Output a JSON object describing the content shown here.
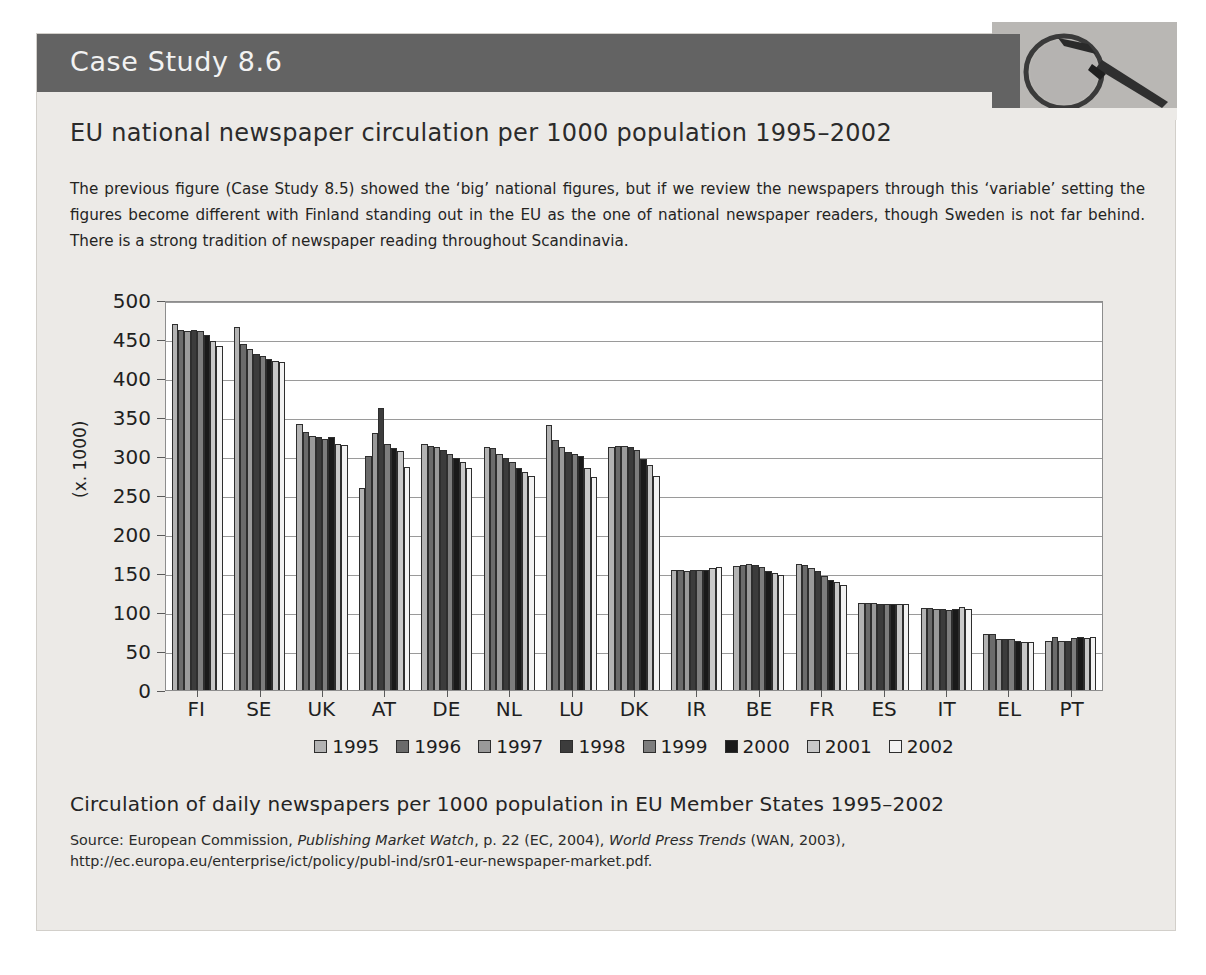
{
  "header": {
    "case_study_label": "Case Study 8.6",
    "icon": "magnifying-glass-icon",
    "bar_color": "#636363"
  },
  "page_title": "EU national newspaper circulation per 1000 population 1995–2002",
  "intro_paragraph": "The previous figure (Case Study 8.5) showed the ‘big’ national figures, but if we review the newspapers through this ‘variable’ setting the figures become different with Finland standing out in the EU as the one of national newspaper readers, though Sweden is not far behind. There is a strong tradition of newspaper reading throughout Scandinavia.",
  "caption": "Circulation of daily newspapers per 1000 population in EU Member States 1995–2002",
  "source": {
    "prefix": "Source: European Commission, ",
    "italic1": "Publishing Market Watch",
    "mid": ", p. 22 (EC, 2004), ",
    "italic2": "World Press Trends",
    "suffix": " (WAN, 2003), http://ec.europa.eu/enterprise/ict/policy/publ-ind/sr01-eur-newspaper-market.pdf."
  },
  "chart_data": {
    "type": "bar",
    "title": "EU national newspaper circulation per 1000 population 1995–2002",
    "xlabel": "",
    "ylabel": "(x. 1000)",
    "ylim": [
      0,
      500
    ],
    "yticks": [
      0,
      50,
      100,
      150,
      200,
      250,
      300,
      350,
      400,
      450,
      500
    ],
    "grid": true,
    "legend_position": "bottom",
    "categories": [
      "FI",
      "SE",
      "UK",
      "AT",
      "DE",
      "NL",
      "LU",
      "DK",
      "IR",
      "BE",
      "FR",
      "ES",
      "IT",
      "EL",
      "PT"
    ],
    "series": [
      {
        "name": "1995",
        "color": "#b3b3b3",
        "values": [
          469,
          465,
          341,
          259,
          315,
          311,
          340,
          311,
          154,
          159,
          162,
          111,
          105,
          72,
          63
        ]
      },
      {
        "name": "1996",
        "color": "#6b6b6b",
        "values": [
          462,
          443,
          331,
          300,
          313,
          310,
          320,
          313,
          154,
          160,
          160,
          111,
          105,
          72,
          68
        ]
      },
      {
        "name": "1997",
        "color": "#9a9a9a",
        "values": [
          460,
          437,
          326,
          330,
          311,
          302,
          312,
          313,
          153,
          161,
          157,
          111,
          104,
          66,
          63
        ]
      },
      {
        "name": "1998",
        "color": "#3c3c3c",
        "values": [
          461,
          431,
          325,
          362,
          308,
          298,
          305,
          311,
          154,
          160,
          152,
          110,
          104,
          66,
          63
        ]
      },
      {
        "name": "1999",
        "color": "#7d7d7d",
        "values": [
          460,
          428,
          322,
          315,
          303,
          292,
          302,
          308,
          154,
          158,
          146,
          110,
          103,
          65,
          67
        ]
      },
      {
        "name": "2000",
        "color": "#1a1a1a",
        "values": [
          455,
          424,
          324,
          310,
          297,
          285,
          300,
          296,
          154,
          153,
          141,
          110,
          104,
          63,
          68
        ]
      },
      {
        "name": "2001",
        "color": "#c8c8c8",
        "values": [
          447,
          422,
          315,
          307,
          292,
          280,
          285,
          288,
          157,
          150,
          138,
          110,
          106,
          62,
          67
        ]
      },
      {
        "name": "2002",
        "color": "#f2f2f2",
        "values": [
          441,
          420,
          314,
          286,
          285,
          275,
          273,
          274,
          158,
          148,
          134,
          110,
          104,
          62,
          68
        ]
      }
    ]
  }
}
